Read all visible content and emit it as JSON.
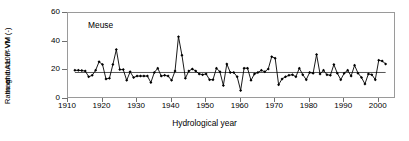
{
  "figure": {
    "annotation": "Meuse",
    "xlabel": "Hydrological year",
    "ylabel_line1": "Ratio of",
    "ylabel_line2": "magnitude of VM",
    "ylabel_line3": "and A10P-VM (-)"
  },
  "chart_data": {
    "type": "line",
    "title": "",
    "subtitle": "",
    "annotations": [
      "Meuse"
    ],
    "xlabel": "Hydrological year",
    "ylabel": "Ratio of magnitude of VM and A10P-VM (-)",
    "xlim": [
      1910,
      2005
    ],
    "ylim": [
      0,
      60
    ],
    "xticks": [
      1910,
      1920,
      1930,
      1940,
      1950,
      1960,
      1970,
      1980,
      1990,
      2000
    ],
    "yticks": [
      0,
      20,
      40,
      60
    ],
    "xtick_labels": [
      "1910",
      "1920",
      "1930",
      "1940",
      "1950",
      "1960",
      "1970",
      "1980",
      "1990",
      "2000"
    ],
    "ytick_labels": [
      "0",
      "20",
      "40",
      "60"
    ],
    "grid": false,
    "legend": null,
    "marker": "filled-diamond",
    "line_color": "#000000",
    "mean_line": {
      "value": 18.5,
      "color": "#555555",
      "x_start": 1912,
      "x_end": 2002
    },
    "x": [
      1912,
      1913,
      1914,
      1915,
      1916,
      1917,
      1918,
      1919,
      1920,
      1921,
      1922,
      1923,
      1924,
      1925,
      1926,
      1927,
      1928,
      1929,
      1930,
      1931,
      1932,
      1933,
      1934,
      1935,
      1936,
      1937,
      1938,
      1939,
      1940,
      1941,
      1942,
      1943,
      1944,
      1945,
      1946,
      1947,
      1948,
      1949,
      1950,
      1951,
      1952,
      1953,
      1954,
      1955,
      1956,
      1957,
      1958,
      1959,
      1960,
      1961,
      1962,
      1963,
      1964,
      1965,
      1966,
      1967,
      1968,
      1969,
      1970,
      1971,
      1972,
      1973,
      1974,
      1975,
      1976,
      1977,
      1978,
      1979,
      1980,
      1981,
      1982,
      1983,
      1984,
      1985,
      1986,
      1987,
      1988,
      1989,
      1990,
      1991,
      1992,
      1993,
      1994,
      1995,
      1996,
      1997,
      1998,
      1999,
      2000,
      2001,
      2002
    ],
    "y": [
      20.0,
      20.0,
      19.8,
      19.5,
      15.5,
      16.5,
      20.0,
      26.0,
      24.0,
      14.0,
      14.5,
      24.0,
      34.5,
      20.5,
      20.5,
      13.0,
      19.0,
      15.0,
      16.0,
      16.0,
      16.0,
      16.0,
      11.5,
      18.5,
      21.5,
      16.0,
      16.5,
      16.0,
      13.0,
      19.5,
      43.5,
      30.5,
      14.5,
      19.5,
      21.0,
      19.5,
      17.5,
      17.0,
      17.5,
      13.5,
      13.5,
      21.5,
      19.0,
      9.5,
      24.5,
      18.5,
      18.5,
      15.5,
      6.0,
      21.5,
      21.5,
      13.0,
      17.5,
      18.5,
      20.0,
      19.0,
      21.0,
      29.5,
      28.5,
      10.0,
      14.0,
      15.5,
      16.5,
      17.0,
      15.5,
      21.5,
      17.0,
      13.5,
      18.5,
      18.0,
      31.0,
      17.5,
      20.0,
      17.0,
      16.5,
      24.0,
      18.0,
      13.5,
      18.0,
      20.0,
      16.0,
      23.5,
      18.0,
      15.0,
      10.5,
      17.5,
      17.0,
      13.5,
      27.0,
      26.5,
      24.5
    ],
    "series": [
      {
        "name": "VM / A10P-VM ratio",
        "values": [
          20.0,
          20.0,
          19.8,
          19.5,
          15.5,
          16.5,
          20.0,
          26.0,
          24.0,
          14.0,
          14.5,
          24.0,
          34.5,
          20.5,
          20.5,
          13.0,
          19.0,
          15.0,
          16.0,
          16.0,
          16.0,
          16.0,
          11.5,
          18.5,
          21.5,
          16.0,
          16.5,
          16.0,
          13.0,
          19.5,
          43.5,
          30.5,
          14.5,
          19.5,
          21.0,
          19.5,
          17.5,
          17.0,
          17.5,
          13.5,
          13.5,
          21.5,
          19.0,
          9.5,
          24.5,
          18.5,
          18.5,
          15.5,
          6.0,
          21.5,
          21.5,
          13.0,
          17.5,
          18.5,
          20.0,
          19.0,
          21.0,
          29.5,
          28.5,
          10.0,
          14.0,
          15.5,
          16.5,
          17.0,
          15.5,
          21.5,
          17.0,
          13.5,
          18.5,
          18.0,
          31.0,
          17.5,
          20.0,
          17.0,
          16.5,
          24.0,
          18.0,
          13.5,
          18.0,
          20.0,
          16.0,
          23.5,
          18.0,
          15.0,
          10.5,
          17.5,
          17.0,
          13.5,
          27.0,
          26.5,
          24.5
        ]
      }
    ]
  }
}
